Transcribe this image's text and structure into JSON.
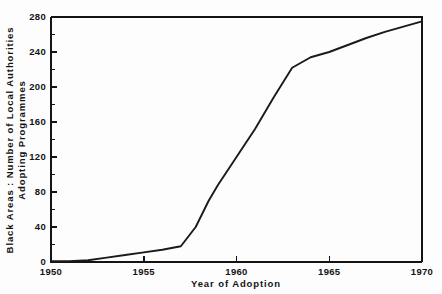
{
  "chart_data": {
    "type": "line",
    "title": "",
    "xlabel": "Year of Adoption",
    "ylabel": "Black Areas : Number of Local Authorities Adopting Programmes",
    "ylabel_lines": [
      "Black Areas : Number of Local Authorities",
      "Adopting Programmes"
    ],
    "xlim": [
      1950,
      1970
    ],
    "ylim": [
      0,
      280
    ],
    "grid": false,
    "legend": null,
    "x_major_ticks": [
      1950,
      1955,
      1960,
      1965,
      1970
    ],
    "x_tick_labels": [
      "1950",
      "1955",
      "1960",
      "1965",
      "1970"
    ],
    "y_major_ticks": [
      0,
      40,
      80,
      120,
      160,
      200,
      240,
      280
    ],
    "y_tick_labels": [
      "0",
      "40",
      "80",
      "120",
      "160",
      "200",
      "240",
      "280"
    ],
    "y_minor_ticks": [
      20,
      60,
      100,
      140,
      180,
      220,
      260
    ],
    "series": [
      {
        "name": "Local authorities adopting programmes",
        "color": "#1a1a1a",
        "x": [
          1950,
          1951,
          1952,
          1953,
          1954,
          1955,
          1956,
          1957,
          1957.8,
          1958.5,
          1959,
          1960,
          1961,
          1962,
          1963,
          1963.5,
          1964,
          1965,
          1966,
          1967,
          1968,
          1969,
          1970
        ],
        "values": [
          1,
          1,
          2,
          5,
          8,
          11,
          14,
          18,
          40,
          70,
          88,
          120,
          152,
          188,
          222,
          228,
          234,
          240,
          248,
          256,
          263,
          269,
          275
        ]
      }
    ]
  },
  "axes": {
    "x_axis_name": "year-of-adoption-axis",
    "y_axis_name": "local-authorities-count-axis"
  }
}
